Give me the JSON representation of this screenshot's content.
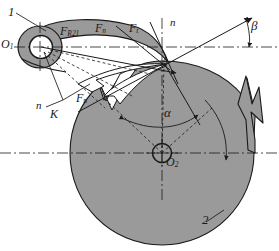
{
  "figure": {
    "type": "mechanical-engineering-schematic",
    "background_color": "#ffffff",
    "body_fill": "#9a9a9a",
    "line_color": "#1a1a1a"
  },
  "labels": {
    "part1": "1",
    "part2": "2",
    "pivot_center": "O",
    "pivot_center_sub": "1",
    "disc_center": "O",
    "disc_center_sub": "2",
    "contact_point": "A",
    "contact_point_k": "K",
    "normal_upper": "n",
    "normal_lower": "n",
    "angle_beta": "β",
    "angle_alpha": "α",
    "force_reaction": "F",
    "force_reaction_sub": "R21",
    "force_normal_upper": "F",
    "force_normal_upper_sub": "n",
    "force_tangential": "F",
    "force_tangential_sub": "t",
    "force_normal_lower": "F",
    "force_normal_lower_sub": "n"
  },
  "geometry": {
    "pivot_o1": {
      "x": 40,
      "y": 47
    },
    "disc_o2": {
      "x": 162,
      "y": 153
    },
    "contact_a": {
      "x": 164,
      "y": 63
    },
    "disc_radius": 92,
    "pivot_hub_outer_r": 19,
    "pivot_hub_inner_r": 11,
    "normal_line_angle_deg": 27,
    "teeth_count": 4
  },
  "annotations": {
    "leader_part1": "leader line from numeral 1 to follower arm body",
    "leader_k": "leader line from K to contact region",
    "dashed_construction": "dashed construction lines from O1 and O2 to contact point",
    "centerline_style": "dash-dot chain lines through O1, O2 and horizontal axis"
  }
}
